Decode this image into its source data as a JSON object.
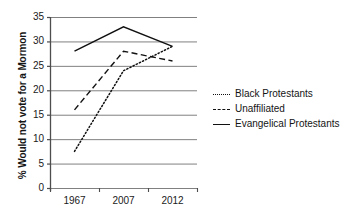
{
  "chart_data": {
    "type": "line",
    "title": "",
    "xlabel": "",
    "ylabel": "% Would not vote for a Mormon",
    "categories": [
      "1967",
      "2007",
      "2012"
    ],
    "ylim": [
      0,
      35
    ],
    "ytick_values": [
      0,
      5,
      10,
      15,
      20,
      25,
      30,
      35
    ],
    "ytick_labels": [
      "0",
      "5",
      "10",
      "15",
      "20",
      "25",
      "30",
      "35"
    ],
    "grid": true,
    "grid_axis": "y",
    "legend_position": "right",
    "series": [
      {
        "name": "Black Protestants",
        "style": "dotted",
        "color": "#111111",
        "values": [
          7.5,
          24,
          29
        ]
      },
      {
        "name": "Unaffiliated",
        "style": "dashed",
        "color": "#111111",
        "values": [
          16,
          28,
          26
        ]
      },
      {
        "name": "Evangelical Protestants",
        "style": "solid",
        "color": "#111111",
        "values": [
          28,
          33,
          29
        ]
      }
    ]
  },
  "axis": {
    "y_label": "% Would not vote for a Mormon",
    "y_ticks": [
      "35",
      "30",
      "25",
      "20",
      "15",
      "10",
      "5",
      "0"
    ],
    "x_ticks": [
      "1967",
      "2007",
      "2012"
    ]
  },
  "legend": {
    "items": [
      {
        "label": "Black Protestants",
        "marker": "dotted-line-icon"
      },
      {
        "label": "Unaffiliated",
        "marker": "dashed-line-icon"
      },
      {
        "label": "Evangelical Protestants",
        "marker": "solid-line-icon"
      }
    ]
  },
  "colors": {
    "line": "#111111",
    "grid": "#808080",
    "axis": "#4d4d4d",
    "background": "#ffffff"
  }
}
